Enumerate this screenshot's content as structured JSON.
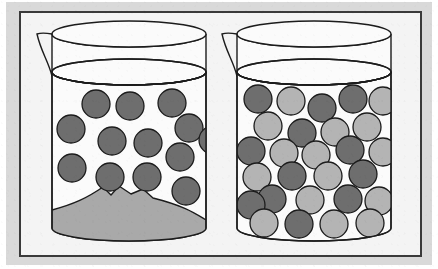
{
  "figure": {
    "width": 438,
    "height": 269
  },
  "colors": {
    "page_background": "#ffffff",
    "outer_background": "#d9d9d9",
    "panel_background": "#f4f4f4",
    "frame_stroke": "#3a3a3a",
    "beaker_stroke": "#1c1c1c",
    "beaker_fill": "#fbfbfb",
    "particle_dark": "#6e6e6e",
    "particle_light": "#b4b4b4",
    "particle_stroke": "#1c1c1c",
    "sediment_fill": "#a9a9a9",
    "sediment_stroke": "#1c1c1c"
  },
  "frame": {
    "name": "outer-frame",
    "x": 20,
    "y": 12,
    "width": 401,
    "height": 244,
    "stroke_width": 2
  },
  "beakers": [
    {
      "id": "left-beaker",
      "label": "Left beaker",
      "contents_label": "Saturated solution with undissolved sediment",
      "body": {
        "left": 52,
        "right": 206,
        "rim_y": 72,
        "bottom_y": 228,
        "rim_ry": 13,
        "base_ry": 13
      },
      "lip": {
        "top_y": 34,
        "top_ry": 13,
        "spout_x": 37,
        "spout_y": 34
      },
      "sediment": {
        "present": true,
        "label": "undissolved-sediment-mound",
        "peak_count": 3,
        "top_y": 186,
        "base_y": 228
      },
      "particles": [
        {
          "x": 96,
          "y": 104,
          "r": 14,
          "shade": "dark"
        },
        {
          "x": 130,
          "y": 106,
          "r": 14,
          "shade": "dark"
        },
        {
          "x": 172,
          "y": 103,
          "r": 14,
          "shade": "dark"
        },
        {
          "x": 71,
          "y": 129,
          "r": 14,
          "shade": "dark"
        },
        {
          "x": 189,
          "y": 128,
          "r": 14,
          "shade": "dark"
        },
        {
          "x": 112,
          "y": 141,
          "r": 14,
          "shade": "dark"
        },
        {
          "x": 148,
          "y": 143,
          "r": 14,
          "shade": "dark"
        },
        {
          "x": 180,
          "y": 157,
          "r": 14,
          "shade": "dark"
        },
        {
          "x": 72,
          "y": 168,
          "r": 14,
          "shade": "dark"
        },
        {
          "x": 110,
          "y": 177,
          "r": 14,
          "shade": "dark"
        },
        {
          "x": 147,
          "y": 177,
          "r": 14,
          "shade": "dark"
        },
        {
          "x": 186,
          "y": 191,
          "r": 14,
          "shade": "dark"
        },
        {
          "x": 213,
          "y": 140,
          "r": 14,
          "shade": "dark"
        }
      ],
      "particle_counts": {
        "dark": 13,
        "light": 0,
        "total": 13
      }
    },
    {
      "id": "right-beaker",
      "label": "Right beaker",
      "contents_label": "Densely packed mixture of two particle types",
      "body": {
        "left": 237,
        "right": 391,
        "rim_y": 72,
        "bottom_y": 228,
        "rim_ry": 13,
        "base_ry": 13
      },
      "lip": {
        "top_y": 34,
        "top_ry": 13,
        "spout_x": 222,
        "spout_y": 34
      },
      "sediment": {
        "present": false,
        "label": "no-sediment"
      },
      "particles": [
        {
          "x": 258,
          "y": 99,
          "r": 14,
          "shade": "dark"
        },
        {
          "x": 291,
          "y": 101,
          "r": 14,
          "shade": "light"
        },
        {
          "x": 322,
          "y": 108,
          "r": 14,
          "shade": "dark"
        },
        {
          "x": 353,
          "y": 99,
          "r": 14,
          "shade": "dark"
        },
        {
          "x": 383,
          "y": 101,
          "r": 14,
          "shade": "light"
        },
        {
          "x": 268,
          "y": 126,
          "r": 14,
          "shade": "light"
        },
        {
          "x": 302,
          "y": 133,
          "r": 14,
          "shade": "dark"
        },
        {
          "x": 335,
          "y": 132,
          "r": 14,
          "shade": "light"
        },
        {
          "x": 367,
          "y": 127,
          "r": 14,
          "shade": "light"
        },
        {
          "x": 251,
          "y": 151,
          "r": 14,
          "shade": "dark"
        },
        {
          "x": 284,
          "y": 153,
          "r": 14,
          "shade": "light"
        },
        {
          "x": 316,
          "y": 155,
          "r": 14,
          "shade": "light"
        },
        {
          "x": 350,
          "y": 150,
          "r": 14,
          "shade": "dark"
        },
        {
          "x": 383,
          "y": 152,
          "r": 14,
          "shade": "light"
        },
        {
          "x": 257,
          "y": 177,
          "r": 14,
          "shade": "light"
        },
        {
          "x": 292,
          "y": 176,
          "r": 14,
          "shade": "dark"
        },
        {
          "x": 328,
          "y": 176,
          "r": 14,
          "shade": "light"
        },
        {
          "x": 363,
          "y": 174,
          "r": 14,
          "shade": "dark"
        },
        {
          "x": 272,
          "y": 199,
          "r": 14,
          "shade": "dark"
        },
        {
          "x": 310,
          "y": 200,
          "r": 14,
          "shade": "light"
        },
        {
          "x": 348,
          "y": 199,
          "r": 14,
          "shade": "dark"
        },
        {
          "x": 379,
          "y": 201,
          "r": 14,
          "shade": "light"
        },
        {
          "x": 251,
          "y": 205,
          "r": 14,
          "shade": "dark"
        },
        {
          "x": 264,
          "y": 223,
          "r": 14,
          "shade": "light"
        },
        {
          "x": 299,
          "y": 224,
          "r": 14,
          "shade": "dark"
        },
        {
          "x": 334,
          "y": 224,
          "r": 14,
          "shade": "light"
        },
        {
          "x": 370,
          "y": 223,
          "r": 14,
          "shade": "light"
        }
      ],
      "particle_counts": {
        "dark": 12,
        "light": 15,
        "total": 27
      }
    }
  ]
}
